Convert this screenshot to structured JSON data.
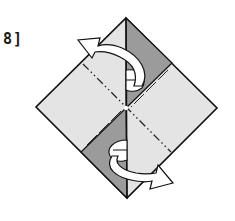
{
  "step": {
    "label": "8]"
  },
  "diagram": {
    "colors": {
      "paper_light": "#e4e4e4",
      "paper_dark": "#9b9b9b",
      "outline": "#111111",
      "arrow_fill": "#ffffff"
    },
    "shapes": {
      "diamond": "126,18 217,108 127,198 36,107",
      "top_dark_panel": "126,18 172,63 126,108",
      "bottom_dark_panel": "126,108 81,152 127,198",
      "center_vertical_line": "126,18 127,198",
      "top_panel_edge": "172,63 126,108",
      "bottom_panel_edge": "126,108 81,152",
      "valley_crease_dashdot": "83,64 171,152"
    },
    "arrows": [
      {
        "name": "fold-back-upper-arrow",
        "direction": "up-left"
      },
      {
        "name": "fold-back-lower-arrow",
        "direction": "down-right"
      }
    ]
  }
}
